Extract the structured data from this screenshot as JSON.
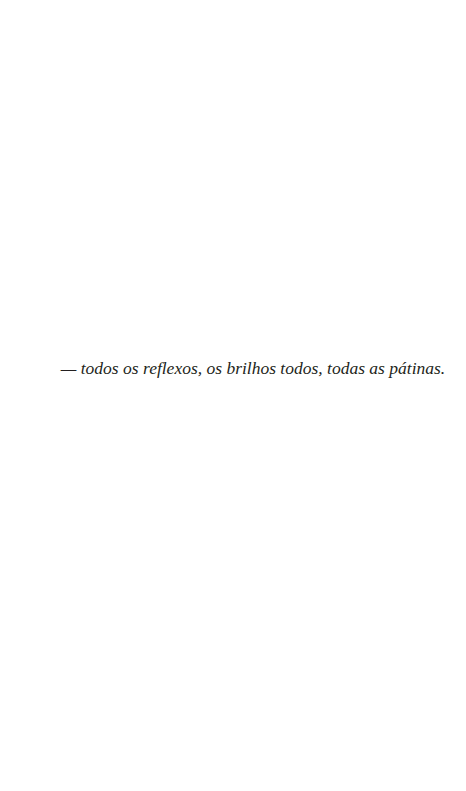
{
  "page": {
    "background": "#ffffff",
    "text_color": "#231f20"
  },
  "epigraph": {
    "text": "— todos os reflexos, os brilhos todos, todas as pátinas."
  }
}
